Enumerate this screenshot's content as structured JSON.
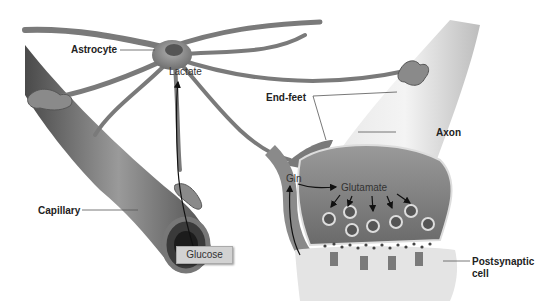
{
  "labels": {
    "astrocyte": "Astrocyte",
    "lactate": "Lactate",
    "end_feet": "End-feet",
    "axon": "Axon",
    "capillary": "Capillary",
    "glucose": "Glucose",
    "gln": "Gln",
    "glutamate": "Glutamate",
    "postsynaptic_cell_line1": "Postsynaptic",
    "postsynaptic_cell_line2": "cell"
  },
  "colors": {
    "astrocyte": "#7d7d7d",
    "capillary": "#6f6f6f",
    "axon": "#d9d9d9",
    "terminal": "#8a8a8a",
    "background": "#ffffff",
    "label_text": "#222222"
  }
}
